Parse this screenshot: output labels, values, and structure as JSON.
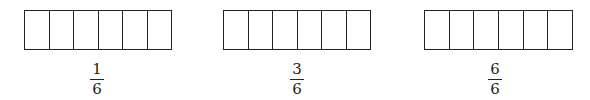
{
  "diagram": {
    "type": "fraction-bars",
    "bars": [
      {
        "cells": 6,
        "shaded": 0,
        "label": {
          "numerator": "1",
          "denominator": "6"
        }
      },
      {
        "cells": 6,
        "shaded": 0,
        "label": {
          "numerator": "3",
          "denominator": "6"
        }
      },
      {
        "cells": 6,
        "shaded": 0,
        "label": {
          "numerator": "6",
          "denominator": "6"
        }
      }
    ],
    "colors": {
      "stroke": "#222222",
      "fill": "#ffffff",
      "text": "#222222"
    }
  }
}
